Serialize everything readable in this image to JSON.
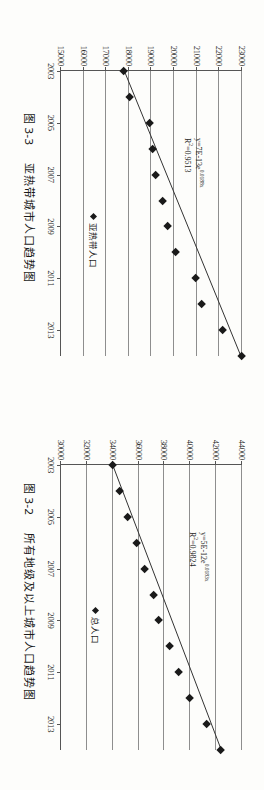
{
  "document": {
    "kind": "scanned-book-page",
    "orientation": "rotated-90-clockwise"
  },
  "figures": [
    {
      "id": "fig-3-3",
      "caption_number": "图 3-3",
      "caption_text": "亚热带城市人口趋势图",
      "equation": "y=7E-13e",
      "equation_exponent": "0.0188x",
      "r_squared": "R2=0.9513",
      "r_squared_sup": "2",
      "r_squared_value": "=0.9513",
      "legend_label": "亚热带人口",
      "legend_marker": "diamond-marker-icon"
    },
    {
      "id": "fig-3-2",
      "caption_number": "图 3-2",
      "caption_text": "所有地级及以上城市人口趋势图",
      "equation": "y=5E-12e",
      "equation_exponent": "0.0183x",
      "r_squared": "R2=0.9824",
      "r_squared_sup": "2",
      "r_squared_value": "=0.9824",
      "legend_label": "总人口",
      "legend_marker": "diamond-marker-icon"
    }
  ],
  "chart_data": [
    {
      "type": "scatter",
      "id": "fig-3-3",
      "title": "图 3-3 亚热带城市人口趋势图",
      "xlabel": "",
      "ylabel": "",
      "xlim": [
        2003,
        2014
      ],
      "ylim": [
        15000,
        23000
      ],
      "yticks": [
        23000,
        22000,
        21000,
        20000,
        19000,
        18000,
        17000,
        16000,
        15000
      ],
      "ytick_labels": [
        "23000",
        "22000",
        "21000",
        "20000",
        "19000",
        "18000",
        "17000",
        "16000",
        "15000"
      ],
      "xticks": [
        2003,
        2005,
        2007,
        2009,
        2011,
        2013
      ],
      "xtick_labels": [
        "2003",
        "2005",
        "2007",
        "2009",
        "2011",
        "2013"
      ],
      "grid": true,
      "legend": [
        "亚热带人口"
      ],
      "legend_position": "inside-lower-right",
      "annotations": [
        "y=7E-13e0.0188x",
        "R2=0.9513"
      ],
      "x": [
        2003,
        2004,
        2005,
        2006,
        2007,
        2008,
        2009,
        2010,
        2011,
        2012,
        2013,
        2014
      ],
      "values": [
        17800,
        18050,
        18950,
        19050,
        19200,
        19500,
        19750,
        20100,
        20950,
        21250,
        22150,
        23000
      ],
      "trendline": {
        "kind": "exponential",
        "equation": "y=7E-13e^(0.0188x)",
        "r2": 0.9513,
        "x_start": 2003,
        "y_start": 17800,
        "x_end": 2014,
        "y_end": 22950
      }
    },
    {
      "type": "scatter",
      "id": "fig-3-2",
      "title": "图 3-2 所有地级及以上城市人口趋势图",
      "xlabel": "",
      "ylabel": "",
      "xlim": [
        2003,
        2014
      ],
      "ylim": [
        30000,
        44000
      ],
      "yticks": [
        44000,
        42000,
        40000,
        38000,
        36000,
        34000,
        32000,
        30000
      ],
      "ytick_labels": [
        "44000",
        "42000",
        "40000",
        "38000",
        "36000",
        "34000",
        "32000",
        "30000"
      ],
      "xticks": [
        2003,
        2005,
        2007,
        2009,
        2011,
        2013
      ],
      "xtick_labels": [
        "2003",
        "2005",
        "2007",
        "2009",
        "2011",
        "2013"
      ],
      "grid": true,
      "legend": [
        "总人口"
      ],
      "legend_position": "inside-lower-right",
      "annotations": [
        "y=5E-12e0.0183x",
        "R2=0.9824"
      ],
      "x": [
        2003,
        2004,
        2005,
        2006,
        2007,
        2008,
        2009,
        2010,
        2011,
        2012,
        2013,
        2014
      ],
      "values": [
        34000,
        34600,
        35200,
        35900,
        36500,
        37200,
        37600,
        38400,
        39100,
        40000,
        41300,
        42400
      ],
      "trendline": {
        "kind": "exponential",
        "equation": "y=5E-12e^(0.0183x)",
        "r2": 0.9824,
        "x_start": 2003,
        "y_start": 34000,
        "x_end": 2014,
        "y_end": 42400
      }
    }
  ]
}
